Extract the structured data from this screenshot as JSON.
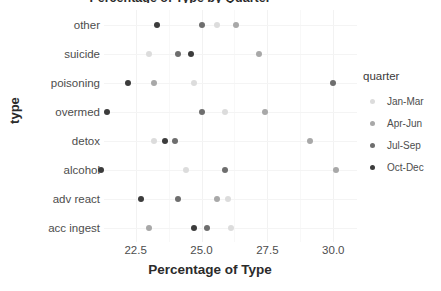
{
  "chart_data": {
    "type": "scatter",
    "title": "Percentage of Type by Quarter",
    "xlabel": "Percentage of Type",
    "ylabel": "type",
    "xlim": [
      21.3,
      30.9
    ],
    "xticks": [
      22.5,
      25.0,
      27.5,
      30.0
    ],
    "xtick_labels": [
      "22.5",
      "25.0",
      "27.5",
      "30.0"
    ],
    "categories": [
      "other",
      "suicide",
      "poisoning",
      "overmed",
      "detox",
      "alcohol",
      "adv react",
      "acc ingest"
    ],
    "grid": true,
    "legend_position": "right",
    "legend_title": "quarter",
    "series": [
      {
        "name": "Jan-Mar",
        "color": "#dcdcdc",
        "values": [
          25.6,
          23.0,
          24.7,
          25.9,
          23.2,
          24.4,
          26.0,
          26.1
        ]
      },
      {
        "name": "Apr-Jun",
        "color": "#a8a8a8",
        "values": [
          26.3,
          27.2,
          23.2,
          27.4,
          29.1,
          30.1,
          25.6,
          23.0
        ]
      },
      {
        "name": "Jul-Sep",
        "color": "#6e6e6e",
        "values": [
          25.0,
          24.1,
          30.0,
          25.0,
          24.0,
          25.9,
          24.1,
          25.2
        ]
      },
      {
        "name": "Oct-Dec",
        "color": "#3c3c3c",
        "values": [
          23.3,
          24.6,
          22.2,
          21.4,
          23.6,
          21.2,
          22.7,
          24.7
        ]
      }
    ]
  }
}
